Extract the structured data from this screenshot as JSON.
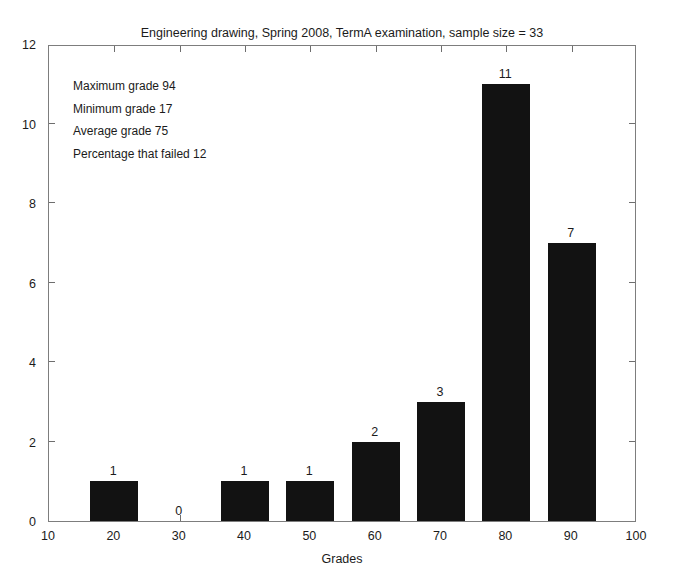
{
  "chart_data": {
    "type": "bar",
    "title": "Engineering drawing, Spring 2008, TermA examination, sample size = 33",
    "xlabel": "Grades",
    "ylabel": "",
    "xlim": [
      10,
      100
    ],
    "ylim": [
      0,
      12
    ],
    "xticks": [
      10,
      20,
      30,
      40,
      50,
      60,
      70,
      80,
      90,
      100
    ],
    "yticks": [
      0,
      2,
      4,
      6,
      8,
      10,
      12
    ],
    "grid": false,
    "legend": null,
    "bar_color": "#121212",
    "bar_width_units": 7.3,
    "categories": [
      20,
      30,
      40,
      50,
      60,
      70,
      80,
      90
    ],
    "values": [
      1,
      0,
      1,
      1,
      2,
      3,
      11,
      7
    ],
    "data_labels": [
      "1",
      "0",
      "1",
      "1",
      "2",
      "3",
      "11",
      "7"
    ],
    "annotations": [
      "Maximum grade 94",
      "Minimum grade 17",
      "Average grade 75",
      "Percentage that failed 12"
    ]
  },
  "stats": {
    "maximum": "Maximum grade 94",
    "minimum": "Minimum grade 17",
    "average": "Average grade 75",
    "failed": "Percentage that failed 12"
  }
}
